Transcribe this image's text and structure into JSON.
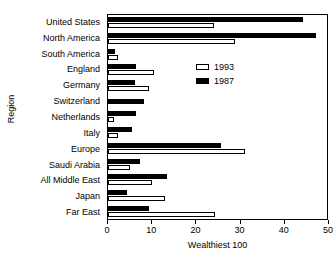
{
  "chart_data": {
    "type": "bar",
    "orientation": "horizontal",
    "title": "",
    "xlabel": "Wealthiest 100",
    "ylabel": "Region",
    "xlim": [
      0,
      50
    ],
    "xticks": [
      0,
      10,
      20,
      30,
      40,
      50
    ],
    "grid": false,
    "legend_position": "inside-upper-right",
    "categories": [
      "United States",
      "North America",
      "South America",
      "England",
      "Germany",
      "Switzerland",
      "Netherlands",
      "Italy",
      "Europe",
      "Saudi Arabia",
      "All Middle East",
      "Japan",
      "Far East"
    ],
    "series": [
      {
        "name": "1993",
        "color": "#ffffff",
        "values": [
          24.0,
          28.7,
          2.3,
          10.3,
          9.2,
          0.0,
          1.3,
          2.3,
          31.0,
          5.0,
          10.0,
          12.8,
          24.3
        ]
      },
      {
        "name": "1987",
        "color": "#000000",
        "values": [
          44.1,
          47.0,
          1.5,
          6.3,
          6.2,
          8.2,
          6.3,
          5.5,
          25.5,
          7.3,
          13.3,
          4.3,
          9.3
        ]
      }
    ]
  },
  "legend": {
    "entries": [
      {
        "label": "1993",
        "swatch": "hollow-square"
      },
      {
        "label": "1987",
        "swatch": "filled-square"
      }
    ]
  },
  "axes": {
    "x_title": "Wealthiest 100",
    "y_title": "Region",
    "x_tick_labels": [
      "0",
      "10",
      "20",
      "30",
      "40",
      "50"
    ]
  }
}
